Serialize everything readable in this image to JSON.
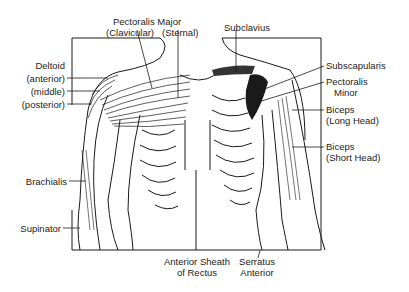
{
  "diagram": {
    "type": "anatomical-illustration",
    "labels": {
      "pectoralis_major": "Pectoralis Major",
      "pectoralis_clavicular": "(Clavicular)",
      "pectoralis_sternal": "(Sternal)",
      "subclavius": "Subclavius",
      "deltoid": "Deltoid",
      "deltoid_anterior": "(anterior)",
      "deltoid_middle": "(middle)",
      "deltoid_posterior": "(posterior)",
      "subscapularis": "Subscapularis",
      "pectoralis_minor_1": "Pectoralis",
      "pectoralis_minor_2": "Minor",
      "biceps_long_1": "Biceps",
      "biceps_long_2": "(Long Head)",
      "biceps_short_1": "Biceps",
      "biceps_short_2": "(Short Head)",
      "brachialis": "Brachialis",
      "supinator": "Supinator",
      "rectus_sheath_1": "Anterior Sheath",
      "rectus_sheath_2": "of Rectus",
      "serratus_1": "Serratus",
      "serratus_2": "Anterior"
    },
    "colors": {
      "ink": "#1a1a1a",
      "background": "#ffffff"
    }
  }
}
